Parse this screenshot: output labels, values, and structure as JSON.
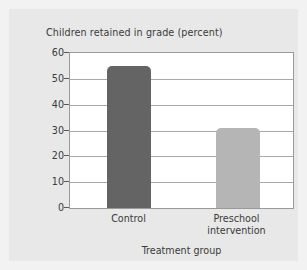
{
  "chart_data": {
    "type": "bar",
    "title": "Children retained in grade (percent)",
    "xlabel": "Treatment group",
    "ylabel": "",
    "categories": [
      "Control",
      "Preschool\nintervention"
    ],
    "values": [
      55,
      31
    ],
    "ylim": [
      0,
      60
    ],
    "yticks": [
      0,
      10,
      20,
      30,
      40,
      50,
      60
    ],
    "ytick_labels": [
      "0",
      "10",
      "20",
      "30",
      "40",
      "50",
      "60"
    ],
    "grid": "horizontal",
    "legend": "none",
    "bar_colors": [
      "#646464",
      "#b5b5b5"
    ],
    "series": [
      {
        "name": "Children retained in grade (percent)",
        "values": [
          55,
          31
        ]
      }
    ]
  },
  "figure": {
    "background_color": "#e8e8e8",
    "plot_background_color": "#ffffff",
    "grid_color": "#a8a8a8",
    "text_color": "#3a3a3a"
  }
}
